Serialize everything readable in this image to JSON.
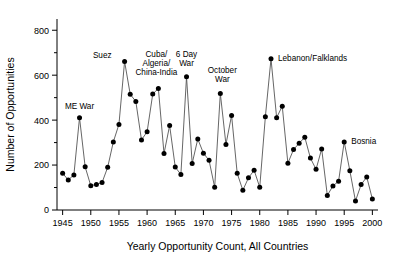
{
  "chart_data": {
    "type": "line",
    "title": "",
    "xlabel": "Yearly Opportunity Count, All Countries",
    "ylabel": "Number of Opportunities",
    "xlim": [
      1944,
      2001
    ],
    "ylim": [
      0,
      850
    ],
    "ytick_values": [
      0,
      200,
      400,
      600,
      800
    ],
    "ytick_labels": [
      "0",
      "200",
      "400",
      "600",
      "800"
    ],
    "yminor_values": [
      100,
      300,
      500,
      700
    ],
    "xtick_values": [
      1945,
      1950,
      1955,
      1960,
      1965,
      1970,
      1975,
      1980,
      1985,
      1990,
      1995,
      2000
    ],
    "xtick_labels": [
      "1945",
      "1950",
      "1955",
      "1960",
      "1965",
      "1970",
      "1975",
      "1980",
      "1985",
      "1990",
      "1995",
      "2000"
    ],
    "grid": false,
    "legend": null,
    "marker": "filled-circle",
    "line_color": "#555555",
    "marker_color": "#000000",
    "x": [
      1945,
      1946,
      1947,
      1948,
      1949,
      1950,
      1951,
      1952,
      1953,
      1954,
      1955,
      1956,
      1957,
      1958,
      1959,
      1960,
      1961,
      1962,
      1963,
      1964,
      1965,
      1966,
      1967,
      1968,
      1969,
      1970,
      1971,
      1972,
      1973,
      1974,
      1975,
      1976,
      1977,
      1978,
      1979,
      1980,
      1981,
      1982,
      1983,
      1984,
      1985,
      1986,
      1987,
      1988,
      1989,
      1990,
      1991,
      1992,
      1993,
      1994,
      1995,
      1996,
      1997,
      1998,
      1999,
      2000
    ],
    "values": [
      163,
      134,
      156,
      411,
      192,
      108,
      114,
      122,
      190,
      303,
      381,
      661,
      515,
      483,
      312,
      348,
      516,
      541,
      251,
      376,
      191,
      158,
      593,
      207,
      316,
      253,
      221,
      101,
      519,
      292,
      421,
      163,
      88,
      143,
      177,
      101,
      415,
      673,
      411,
      462,
      208,
      269,
      297,
      324,
      231,
      181,
      272,
      65,
      107,
      128,
      303,
      175,
      40,
      113,
      147,
      49
    ],
    "annotations": [
      {
        "label": "ME War",
        "year": 1948,
        "value": 411
      },
      {
        "label": "Suez",
        "year": 1956,
        "value": 661
      },
      {
        "label": "Cuba/",
        "year": 1962,
        "value": 541
      },
      {
        "label": "Algeria/",
        "year": 1962,
        "value": 541
      },
      {
        "label": "China-India",
        "year": 1962,
        "value": 541
      },
      {
        "label": "6 Day",
        "year": 1967,
        "value": 593
      },
      {
        "label": "War",
        "year": 1967,
        "value": 593
      },
      {
        "label": "October",
        "year": 1973,
        "value": 519
      },
      {
        "label": "War",
        "year": 1973,
        "value": 519
      },
      {
        "label": "Lebanon/Falklands",
        "year": 1982,
        "value": 673
      },
      {
        "label": "Bosnia",
        "year": 1995,
        "value": 303
      }
    ]
  }
}
